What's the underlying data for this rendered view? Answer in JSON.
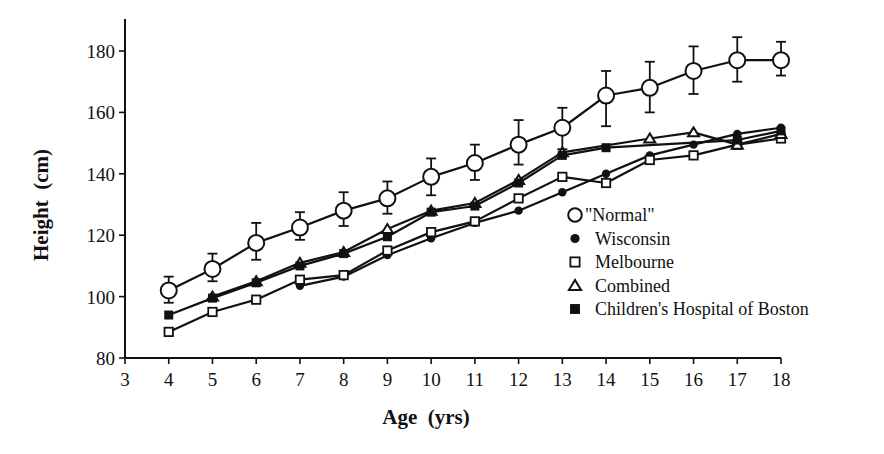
{
  "chart_data": {
    "type": "line",
    "title": "",
    "xlabel": "Age  (yrs)",
    "ylabel": "Height  (cm)",
    "xlim": [
      3,
      18
    ],
    "ylim": [
      80,
      190
    ],
    "x_ticks": [
      3,
      4,
      5,
      6,
      7,
      8,
      9,
      10,
      11,
      12,
      13,
      14,
      15,
      16,
      17,
      18
    ],
    "y_ticks": [
      80,
      100,
      120,
      140,
      160,
      180
    ],
    "grid": false,
    "legend_position": "right-inside",
    "x": [
      4,
      5,
      6,
      7,
      8,
      9,
      10,
      11,
      12,
      13,
      14,
      15,
      16,
      17,
      18
    ],
    "series": [
      {
        "name": "\"Normal\"",
        "marker": "open-circle",
        "values": [
          102,
          109,
          117.5,
          122.5,
          128,
          132,
          139,
          143.5,
          149.5,
          155,
          165.5,
          168,
          173.5,
          177,
          177
        ],
        "error_low": [
          98,
          105,
          112,
          118.5,
          123,
          127,
          133,
          138,
          143,
          148,
          155.5,
          160,
          166,
          170,
          172
        ],
        "error_high": [
          106.5,
          114,
          124,
          127.5,
          134,
          137.5,
          145,
          149.5,
          157.5,
          161.5,
          173.5,
          176.5,
          181.5,
          184.5,
          183
        ]
      },
      {
        "name": "Wisconsin",
        "marker": "filled-circle",
        "values": [
          null,
          null,
          null,
          103.5,
          106.5,
          113.5,
          119,
          124,
          128,
          134,
          140,
          146,
          149.5,
          153,
          155
        ]
      },
      {
        "name": "Melbourne",
        "marker": "open-square",
        "values": [
          88.5,
          95,
          99,
          105.5,
          107,
          115,
          121,
          124.5,
          132,
          139,
          137,
          144.5,
          146,
          149.5,
          151.5
        ]
      },
      {
        "name": "Combined",
        "marker": "open-triangle",
        "values": [
          null,
          100,
          105,
          111,
          114.5,
          122,
          128,
          130.5,
          138,
          147,
          null,
          151.5,
          153.5,
          149.5,
          153
        ]
      },
      {
        "name": "Children's Hospital of Boston",
        "marker": "filled-square",
        "values": [
          94,
          99.5,
          104.5,
          110,
          114,
          119.5,
          127.5,
          129.5,
          137,
          146,
          148.5,
          null,
          null,
          151,
          154
        ]
      }
    ]
  },
  "axes": {
    "xlabel": "Age  (yrs)",
    "ylabel": "Height  (cm)"
  },
  "legend": {
    "items": [
      {
        "label": "\"Normal\"",
        "marker": "open-circle"
      },
      {
        "label": "Wisconsin",
        "marker": "filled-circle"
      },
      {
        "label": "Melbourne",
        "marker": "open-square"
      },
      {
        "label": "Combined",
        "marker": "open-triangle"
      },
      {
        "label": "Children's Hospital of Boston",
        "marker": "filled-square"
      }
    ]
  },
  "colors": {
    "ink": "#111111",
    "background": "#ffffff"
  }
}
